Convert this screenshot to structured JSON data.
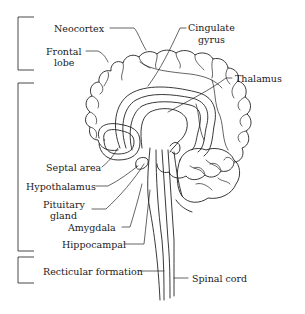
{
  "diagram": {
    "type": "anatomical-illustration",
    "line_color": "#222222",
    "background": "#ffffff"
  },
  "groups": [
    {
      "name": "neocortex-group",
      "bracket_y": [
        17,
        70
      ]
    },
    {
      "name": "limbic-group",
      "bracket_y": [
        83,
        251
      ]
    },
    {
      "name": "brainstem-group",
      "bracket_y": [
        257,
        283
      ]
    }
  ],
  "labels": {
    "neocortex": "Neocortex",
    "frontal_lobe_1": "Frontal",
    "frontal_lobe_2": "lobe",
    "cingulate_1": "Cingulate",
    "cingulate_2": "gyrus",
    "thalamus": "Thalamus",
    "septal_area": "Septal area",
    "hypothalamus": "Hypothalamus",
    "pituitary_1": "Pituitary",
    "pituitary_2": "gland",
    "amygdala": "Amygdala",
    "hippocampal": "Hippocampal",
    "recticular": "Recticular formation",
    "spinal_cord": "Spinal cord"
  }
}
